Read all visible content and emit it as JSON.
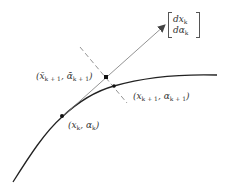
{
  "diagram": {
    "type": "predictor-corrector continuation step",
    "colors": {
      "curve": "#222222",
      "arrow": "#666666",
      "dashed": "#777777",
      "text": "#333333"
    },
    "tangent_vector": {
      "row1_base": "dx",
      "row1_sub": "k",
      "row2_base": "dα",
      "row2_sub": "k"
    },
    "points": [
      {
        "name": "current",
        "base_x": "x",
        "sub_x": "k",
        "base_a": "α",
        "sub_a": "k"
      },
      {
        "name": "predictor",
        "base_x": "x̄",
        "sub_x": "k + 1",
        "base_a": "ᾱ",
        "sub_a": "k + 1"
      },
      {
        "name": "corrector",
        "base_x": "x",
        "sub_x": "k + 1",
        "base_a": "α",
        "sub_a": "k + 1"
      }
    ],
    "punct": {
      "open": "(",
      "comma": ", ",
      "close": ")"
    }
  }
}
